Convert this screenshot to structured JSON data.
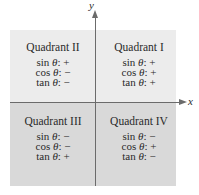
{
  "axes": {
    "x_label": "x",
    "y_label": "y"
  },
  "colors": {
    "top_region": "#ececec",
    "bottom_region": "#d9d9d9",
    "axis": "#6b6b6b",
    "text": "#2a2a2a"
  },
  "quadrants": {
    "q1": {
      "title": "Quadrant I",
      "sin": {
        "fn": "sin",
        "var": "θ",
        "sign": ": +"
      },
      "cos": {
        "fn": "cos",
        "var": "θ",
        "sign": ": +"
      },
      "tan": {
        "fn": "tan",
        "var": "θ",
        "sign": ": +"
      }
    },
    "q2": {
      "title": "Quadrant II",
      "sin": {
        "fn": "sin",
        "var": "θ",
        "sign": ": +"
      },
      "cos": {
        "fn": "cos",
        "var": "θ",
        "sign": ": −"
      },
      "tan": {
        "fn": "tan",
        "var": "θ",
        "sign": ": −"
      }
    },
    "q3": {
      "title": "Quadrant III",
      "sin": {
        "fn": "sin",
        "var": "θ",
        "sign": ": −"
      },
      "cos": {
        "fn": "cos",
        "var": "θ",
        "sign": ": −"
      },
      "tan": {
        "fn": "tan",
        "var": "θ",
        "sign": ": +"
      }
    },
    "q4": {
      "title": "Quadrant IV",
      "sin": {
        "fn": "sin",
        "var": "θ",
        "sign": ": −"
      },
      "cos": {
        "fn": "cos",
        "var": "θ",
        "sign": ": +"
      },
      "tan": {
        "fn": "tan",
        "var": "θ",
        "sign": ": −"
      }
    }
  }
}
